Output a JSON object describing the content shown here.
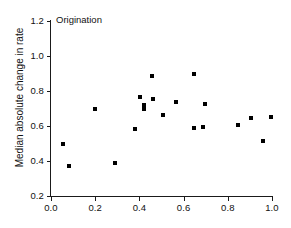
{
  "chart_data": {
    "type": "scatter",
    "title": "Origination",
    "xlabel": "",
    "ylabel": "Median absolute change in rate",
    "xlim": [
      0.0,
      1.0
    ],
    "ylim": [
      0.2,
      1.2
    ],
    "xticks": [
      "0.0",
      "0.2",
      "0.4",
      "0.6",
      "0.8",
      "1.0"
    ],
    "xtick_values": [
      0.0,
      0.2,
      0.4,
      0.6,
      0.8,
      1.0
    ],
    "yticks": [
      "0.2",
      "0.4",
      "0.6",
      "0.8",
      "1.0",
      "1.2"
    ],
    "ytick_values": [
      0.2,
      0.4,
      0.6,
      0.8,
      1.0,
      1.2
    ],
    "grid": false,
    "legend": null,
    "marker": "square",
    "marker_color": "#000000",
    "axis_color": "#1a1a1a",
    "background": "#ffffff",
    "n_points": 22,
    "points": [
      {
        "x": 0.055,
        "y": 0.5
      },
      {
        "x": 0.08,
        "y": 0.37
      },
      {
        "x": 0.2,
        "y": 0.695
      },
      {
        "x": 0.288,
        "y": 0.387
      },
      {
        "x": 0.378,
        "y": 0.585
      },
      {
        "x": 0.402,
        "y": 0.768
      },
      {
        "x": 0.42,
        "y": 0.722
      },
      {
        "x": 0.42,
        "y": 0.7
      },
      {
        "x": 0.455,
        "y": 0.888
      },
      {
        "x": 0.462,
        "y": 0.755
      },
      {
        "x": 0.505,
        "y": 0.663
      },
      {
        "x": 0.565,
        "y": 0.735
      },
      {
        "x": 0.645,
        "y": 0.895
      },
      {
        "x": 0.648,
        "y": 0.588
      },
      {
        "x": 0.688,
        "y": 0.592
      },
      {
        "x": 0.695,
        "y": 0.725
      },
      {
        "x": 0.845,
        "y": 0.603
      },
      {
        "x": 0.905,
        "y": 0.643
      },
      {
        "x": 0.958,
        "y": 0.512
      },
      {
        "x": 0.995,
        "y": 0.652
      }
    ]
  }
}
